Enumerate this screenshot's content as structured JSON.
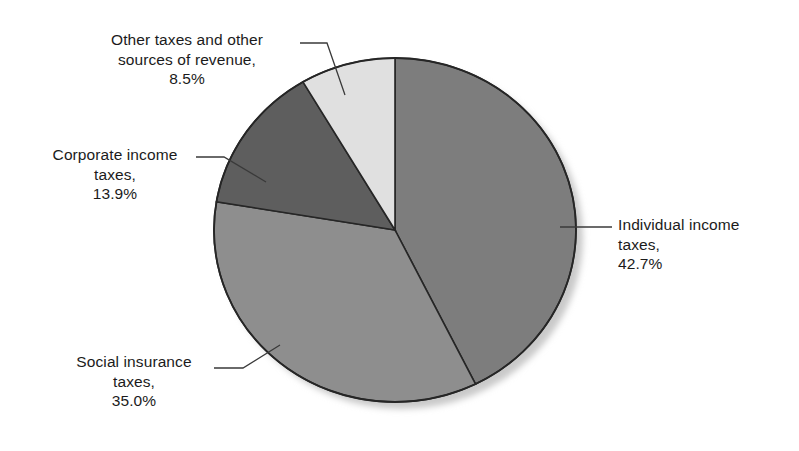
{
  "chart_data": {
    "type": "pie",
    "title": "",
    "subtitle": "",
    "xlabel": "",
    "ylabel": "",
    "legend_position": "none",
    "grid": false,
    "units": "percent",
    "start_angle_deg": 0,
    "direction": "clockwise",
    "categories": [
      "Individual income taxes",
      "Social insurance taxes",
      "Corporate income taxes",
      "Other taxes and other sources of revenue"
    ],
    "values": [
      42.7,
      35.0,
      13.9,
      8.5
    ],
    "slices": [
      {
        "name": "Individual income taxes",
        "value": 42.7,
        "value_text": "42.7%",
        "label_line1": "Individual income",
        "label_line2": "taxes,",
        "label_line3": "42.7%",
        "color": "#7d7d7d"
      },
      {
        "name": "Social insurance taxes",
        "value": 35.0,
        "value_text": "35.0%",
        "label_line1": "Social insurance",
        "label_line2": "taxes,",
        "label_line3": "35.0%",
        "color": "#8e8e8e"
      },
      {
        "name": "Corporate income taxes",
        "value": 13.9,
        "value_text": "13.9%",
        "label_line1": "Corporate income",
        "label_line2": "taxes,",
        "label_line3": "13.9%",
        "color": "#5e5e5e"
      },
      {
        "name": "Other taxes and other sources of revenue",
        "value": 8.5,
        "value_text": "8.5%",
        "label_line1": "Other taxes and other",
        "label_line2": "sources of revenue,",
        "label_line3": "8.5%",
        "color": "#e0e0e0"
      }
    ]
  },
  "labels": {
    "individual": "Individual income\ntaxes,\n42.7%",
    "social": "Social insurance\ntaxes,\n35.0%",
    "corporate": "Corporate income\ntaxes,\n13.9%",
    "other": "Other taxes and other\nsources of revenue,\n8.5%"
  },
  "colors": {
    "individual": "#7d7d7d",
    "social": "#8e8e8e",
    "corporate": "#5e5e5e",
    "other": "#e0e0e0",
    "outline": "#262626",
    "leader_line": "#3a3a3a",
    "background": "#ffffff",
    "shadow": "#c9c9c9"
  }
}
